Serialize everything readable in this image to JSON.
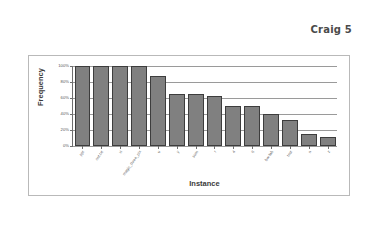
{
  "header": {
    "title": "Craig 5"
  },
  "chart_data": {
    "type": "bar",
    "title": "",
    "xlabel": "Instance",
    "ylabel": "Frequency",
    "ylim": [
      0,
      100
    ],
    "yticks": [
      "0%",
      "20%",
      "40%",
      "60%",
      "80%",
      "100%"
    ],
    "ytick_values": [
      0,
      20,
      40,
      60,
      80,
      100
    ],
    "grid": "horizontal",
    "legend": "none",
    "bar_color": "#808080",
    "bar_edge_color": "#3d3d3d",
    "categories": [
      "ppt",
      "out.txt",
      "vi",
      "magic_three_pix",
      "u",
      "y",
      "sum",
      "r",
      "4",
      "6",
      "bw-lab",
      "test",
      "n",
      "z"
    ],
    "values": [
      100,
      100,
      100,
      100,
      88,
      65,
      65,
      63,
      50,
      50,
      40,
      33,
      15,
      11
    ],
    "value_unit": "%"
  }
}
